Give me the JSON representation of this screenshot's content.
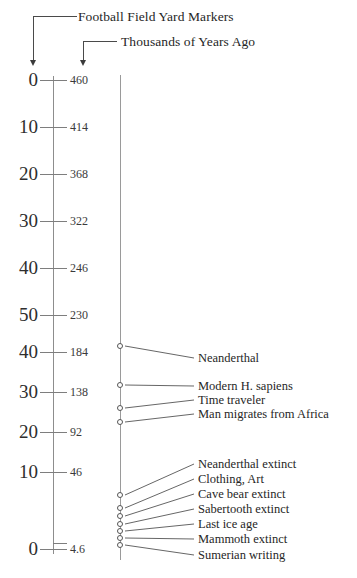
{
  "figure": {
    "callouts": [
      {
        "id": "football-field-yard-markers",
        "text": "Football Field Yard Markers"
      },
      {
        "id": "thousands-of-years-ago",
        "text": "Thousands of Years Ago"
      }
    ]
  },
  "chart_data": {
    "type": "timeline",
    "title": "Football Field Yard Markers",
    "subtitle": "Thousands of Years Ago",
    "xlabel": "",
    "ylabel": "Thousands of Years Ago",
    "grid": false,
    "legend": "none",
    "orientation": "vertical",
    "axes": [
      {
        "name": "yard_markers",
        "label": "Football Field Yard Markers",
        "tick_labels": [
          "0",
          "10",
          "20",
          "30",
          "40",
          "50",
          "40",
          "30",
          "20",
          "10",
          "0"
        ]
      },
      {
        "name": "thousands_of_years_ago",
        "label": "Thousands of Years Ago",
        "tick_labels": [
          "460",
          "414",
          "368",
          "322",
          "246",
          "230",
          "184",
          "138",
          "92",
          "46",
          "4.6"
        ]
      }
    ],
    "scale_rows": [
      {
        "yard": "0",
        "kya": "460",
        "y": 80
      },
      {
        "yard": "10",
        "kya": "414",
        "y": 127
      },
      {
        "yard": "20",
        "kya": "368",
        "y": 174
      },
      {
        "yard": "30",
        "kya": "322",
        "y": 221
      },
      {
        "yard": "40",
        "kya": "246",
        "y": 268
      },
      {
        "yard": "50",
        "kya": "230",
        "y": 315
      },
      {
        "yard": "40",
        "kya": "184",
        "y": 352
      },
      {
        "yard": "30",
        "kya": "138",
        "y": 392
      },
      {
        "yard": "20",
        "kya": "92",
        "y": 432
      },
      {
        "yard": "10",
        "kya": "46",
        "y": 472
      },
      {
        "yard": "0",
        "kya": "4.6",
        "y": 549
      }
    ],
    "events": [
      {
        "label": "Neanderthal",
        "marker_y": 346,
        "label_y": 352
      },
      {
        "label": "Modern H. sapiens",
        "marker_y": 385,
        "label_y": 380
      },
      {
        "label": "Time traveler",
        "marker_y": 408,
        "label_y": 394
      },
      {
        "label": "Man migrates from Africa",
        "marker_y": 422,
        "label_y": 408
      },
      {
        "label": "Neanderthal extinct",
        "marker_y": 495,
        "label_y": 458
      },
      {
        "label": "Clothing, Art",
        "marker_y": 508,
        "label_y": 473
      },
      {
        "label": "Cave bear extinct",
        "marker_y": 516,
        "label_y": 488
      },
      {
        "label": "Sabertooth extinct",
        "marker_y": 524,
        "label_y": 503
      },
      {
        "label": "Last ice age",
        "marker_y": 531,
        "label_y": 518
      },
      {
        "label": "Mammoth extinct",
        "marker_y": 538,
        "label_y": 533
      },
      {
        "label": "Sumerian writing",
        "marker_y": 545,
        "label_y": 549
      }
    ]
  },
  "colors": {
    "ink": "#2b2b2b",
    "rule": "#8d8d8d",
    "connector": "#555555",
    "background": "#ffffff"
  }
}
